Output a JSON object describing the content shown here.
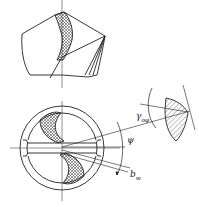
{
  "diagram": {
    "views": [
      {
        "id": "side-view",
        "description": "Drill point side view with cross-hatched cutting lip"
      },
      {
        "id": "end-view",
        "description": "Drill end view with two cross-hatched cutting edges, chisel edge"
      },
      {
        "id": "section-view",
        "description": "Hatched section of cutting lip"
      }
    ],
    "labels": {
      "gamma": {
        "main": "γ",
        "sub": "oφ"
      },
      "psi": {
        "main": "ψ"
      },
      "bw": {
        "main": "b",
        "sub": "w"
      }
    },
    "colors": {
      "line": "#222222",
      "background": "#ffffff"
    }
  }
}
